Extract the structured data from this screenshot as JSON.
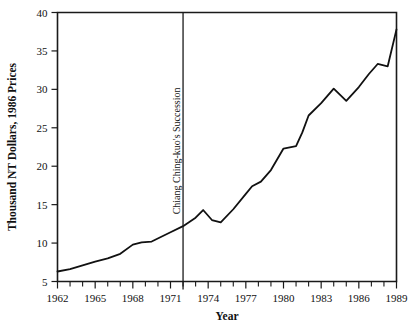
{
  "chart_data": {
    "type": "line",
    "title": "",
    "xlabel": "Year",
    "ylabel": "Thousand NT Dollars, 1986 Prices",
    "xlim": [
      1962,
      1989
    ],
    "ylim": [
      5,
      40
    ],
    "grid": false,
    "legend": null,
    "y_ticks": [
      5,
      10,
      15,
      20,
      25,
      30,
      35,
      40
    ],
    "y_tick_labels": [
      "5",
      "10",
      "15",
      "20",
      "25",
      "30",
      "35",
      "40"
    ],
    "x_ticks": [
      1962,
      1965,
      1968,
      1971,
      1974,
      1977,
      1980,
      1983,
      1986,
      1989
    ],
    "x_tick_labels": [
      "1962",
      "1965",
      "1968",
      "1971",
      "1974",
      "1977",
      "1980",
      "1983",
      "1986",
      "1989"
    ],
    "x_minor_tick_step": 1,
    "line_color": "#111111",
    "series": [
      {
        "name": "Real per-capita income",
        "x": [
          1962,
          1963,
          1964,
          1965,
          1966,
          1967,
          1968,
          1969,
          1970,
          1971,
          1972,
          1973,
          1974,
          1975,
          1976,
          1977,
          1978,
          1979,
          1980,
          1981,
          1982,
          1983,
          1984,
          1985,
          1986,
          1987,
          1988,
          1989
        ],
        "values": [
          6.3,
          6.7,
          7.2,
          7.7,
          8.1,
          8.7,
          9.3,
          10.0,
          10.2,
          10.7,
          11.3,
          11.9,
          12.6,
          13.4,
          14.3,
          13.6,
          13.0,
          14.0,
          16.2,
          18.2,
          20.0,
          21.8,
          22.3,
          23.8,
          26.0,
          28.0,
          30.0,
          28.5
        ]
      }
    ],
    "annotations": [
      {
        "text": "Chiang Ching-kuo's Succession",
        "type": "vertical-line-with-label",
        "x": 1972,
        "orientation": "rotated-90"
      }
    ]
  },
  "chart_series_display": {
    "x": [
      1962,
      1963,
      1964,
      1965,
      1966,
      1967,
      1968,
      1968.7,
      1969.5,
      1971,
      1972,
      1973,
      1973.6,
      1974.3,
      1975,
      1976,
      1977,
      1977.5,
      1978.2,
      1979,
      1980,
      1981,
      1981.5,
      1982,
      1983,
      1984,
      1985,
      1986,
      1986.8,
      1987.5,
      1988.3,
      1989
    ],
    "y": [
      6.3,
      6.6,
      7.1,
      7.6,
      8.0,
      8.6,
      9.8,
      10.1,
      10.2,
      11.4,
      12.2,
      13.3,
      14.3,
      13.0,
      12.7,
      14.4,
      16.4,
      17.4,
      18.0,
      19.5,
      22.3,
      22.6,
      24.4,
      26.6,
      28.2,
      30.1,
      28.5,
      30.3,
      32.0,
      33.3,
      33.0,
      37.8
    ]
  }
}
